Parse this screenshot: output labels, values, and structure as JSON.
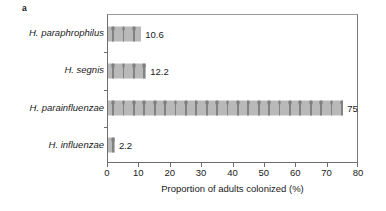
{
  "figure": {
    "panel_label": "a"
  },
  "chart_data": {
    "type": "bar",
    "orientation": "horizontal",
    "title": "",
    "xlabel": "Proportion of adults colonized (%)",
    "ylabel": "",
    "xlim": [
      0,
      80
    ],
    "xticks": [
      0,
      10,
      20,
      30,
      40,
      50,
      60,
      70,
      80
    ],
    "xticklabels": [
      "0",
      "10",
      "20",
      "30",
      "40",
      "50",
      "60",
      "70",
      "80"
    ],
    "grid": false,
    "legend": null,
    "bar_color": "#b9b9b9",
    "bar_pattern": "person-pictogram-repeat",
    "categories": [
      "H. paraphrophilus",
      "H. segnis",
      "H. parainfluenzae",
      "H. influenzae"
    ],
    "values": [
      10.6,
      12.2,
      75,
      2.2
    ],
    "value_labels": [
      "10.6",
      "12.2",
      "75",
      "2.2"
    ],
    "bars": [
      {
        "category": "H. paraphrophilus",
        "value": 10.6,
        "label": "10.6"
      },
      {
        "category": "H. segnis",
        "value": 12.2,
        "label": "12.2"
      },
      {
        "category": "H. parainfluenzae",
        "value": 75,
        "label": "75"
      },
      {
        "category": "H. influenzae",
        "value": 2.2,
        "label": "2.2"
      }
    ]
  }
}
